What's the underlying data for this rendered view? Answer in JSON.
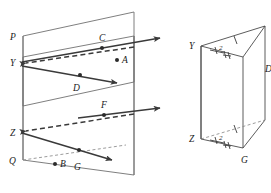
{
  "figure": {
    "type": "geometry-diagram",
    "stroke_color": "#4a4a4a",
    "label_color": "#1a1a1a",
    "background": "#ffffff"
  },
  "left_figure": {
    "name": "intersecting-planes",
    "vertex_labels": {
      "p": "P",
      "y": "Y",
      "z": "Z",
      "q": "Q"
    },
    "point_labels": {
      "a": "A",
      "b": "B",
      "c": "C",
      "d": "D",
      "f": "F",
      "g": "G"
    },
    "rays": [
      {
        "id": "ray-c",
        "label": "C",
        "style": "solid",
        "direction": "right"
      },
      {
        "id": "ray-y",
        "label": "Y",
        "style": "dashed",
        "direction": "left"
      },
      {
        "id": "ray-d",
        "label": "D",
        "style": "solid",
        "direction": "right"
      },
      {
        "id": "ray-f",
        "label": "F",
        "style": "solid",
        "direction": "right"
      },
      {
        "id": "ray-z",
        "label": "Z",
        "style": "dashed",
        "direction": "left"
      },
      {
        "id": "ray-g",
        "label": "G",
        "style": "solid",
        "direction": "right"
      }
    ],
    "isolated_points": [
      {
        "id": "point-a",
        "label": "A"
      },
      {
        "id": "point-b",
        "label": "B"
      }
    ]
  },
  "right_figure": {
    "name": "prism-with-tick-marks",
    "vertex_labels": {
      "y": "Y",
      "z": "Z",
      "d": "D",
      "g": "G"
    },
    "congruence_marks": {
      "top_edge_single_tick": "|",
      "top_angle_double_tick": "||",
      "bottom_edge_single_tick": "|",
      "bottom_angle_double_tick": "||"
    },
    "small_numerals": {
      "top": "2",
      "bottom": "2"
    }
  }
}
